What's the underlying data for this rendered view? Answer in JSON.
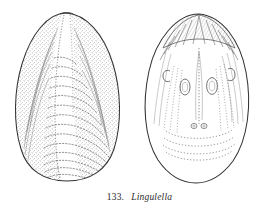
{
  "figure": {
    "caption_number": "133.",
    "caption_genus": "Lingulella",
    "background_color": "#ffffff",
    "ink_color": "#3a3a3a",
    "stipple_color": "#555555",
    "width": 279,
    "height": 215
  },
  "specimens": [
    {
      "id": "left-valve",
      "view": "exterior",
      "shape": "rounded-triangular",
      "features": [
        "umbo-apex",
        "median-ridge",
        "concentric-growth-lines",
        "stippled-shading",
        "radial-striae"
      ],
      "growth_line_count": 14
    },
    {
      "id": "right-valve",
      "view": "interior",
      "shape": "broad-oval",
      "features": [
        "hatched-beak-area",
        "median-septum",
        "paired-oval-muscle-scars",
        "small-paired-scars",
        "lateral-c-shaped-scars",
        "vascular-markings",
        "pallial-arcs"
      ],
      "muscle_scar_count": 2
    }
  ]
}
